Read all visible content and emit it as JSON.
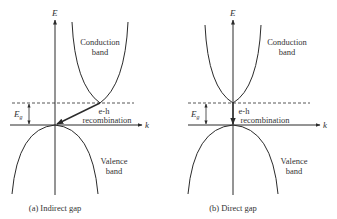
{
  "panels": [
    {
      "id": "indirect",
      "caption": "(a) Indirect gap",
      "axis_e": "E",
      "axis_k": "k",
      "gap_symbol": "E",
      "gap_subscript": "g",
      "conduction_label_1": "Conduction",
      "conduction_label_2": "band",
      "recomb_label_1": "e-h",
      "recomb_label_2": "recombination",
      "valence_label_1": "Valence",
      "valence_label_2": "band"
    },
    {
      "id": "direct",
      "caption": "(b) Direct gap",
      "axis_e": "E",
      "axis_k": "k",
      "gap_symbol": "E",
      "gap_subscript": "g",
      "conduction_label_1": "Conduction",
      "conduction_label_2": "band",
      "recomb_label_1": "e-h",
      "recomb_label_2": "recombination",
      "valence_label_1": "Valence",
      "valence_label_2": "band"
    }
  ],
  "colors": {
    "line": "#2b2b2b",
    "text": "#333333"
  }
}
